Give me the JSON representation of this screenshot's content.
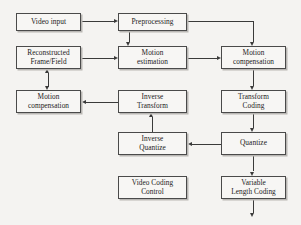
{
  "diagram": {
    "background_color": "#f4f3f1",
    "box_fill_color": "#f7f6f4",
    "box_border_color": "#4a4a4a",
    "line_color": "#3a3a3a",
    "nodes": [
      {
        "id": "video-input",
        "label": "Video input",
        "x": 16,
        "y": 13,
        "w": 65,
        "h": 18,
        "lines": 1
      },
      {
        "id": "preprocessing",
        "label": "Preprocessing",
        "x": 118,
        "y": 13,
        "w": 69,
        "h": 18,
        "lines": 1
      },
      {
        "id": "reconstructed-frame",
        "label": "Reconstructed\nFrame/Field",
        "x": 16,
        "y": 46,
        "w": 65,
        "h": 23,
        "lines": 2
      },
      {
        "id": "motion-estimation",
        "label": "Motion\nestimation",
        "x": 118,
        "y": 46,
        "w": 69,
        "h": 23,
        "lines": 2
      },
      {
        "id": "motion-compensation-top",
        "label": "Motion\ncompensation",
        "x": 221,
        "y": 46,
        "w": 65,
        "h": 23,
        "lines": 2
      },
      {
        "id": "motion-compensation-bottom",
        "label": "Motion\ncompensation",
        "x": 16,
        "y": 90,
        "w": 65,
        "h": 23,
        "lines": 2
      },
      {
        "id": "inverse-transform",
        "label": "Inverse\nTransform",
        "x": 118,
        "y": 90,
        "w": 69,
        "h": 23,
        "lines": 2
      },
      {
        "id": "transform-coding",
        "label": "Transform\nCoding",
        "x": 221,
        "y": 90,
        "w": 65,
        "h": 23,
        "lines": 2
      },
      {
        "id": "inverse-quantize",
        "label": "Inverse\nQuantize",
        "x": 118,
        "y": 132,
        "w": 69,
        "h": 23,
        "lines": 2
      },
      {
        "id": "quantize",
        "label": "Quantize",
        "x": 221,
        "y": 132,
        "w": 65,
        "h": 23,
        "lines": 1
      },
      {
        "id": "video-coding-control",
        "label": "Video Coding\nControl",
        "x": 118,
        "y": 176,
        "w": 69,
        "h": 23,
        "lines": 2
      },
      {
        "id": "variable-length-coding",
        "label": "Variable\nLength Coding",
        "x": 221,
        "y": 176,
        "w": 65,
        "h": 23,
        "lines": 2
      }
    ],
    "edges": [
      {
        "id": "video-input-to-preprocessing",
        "from": "video-input",
        "to": "preprocessing"
      },
      {
        "id": "preprocessing-to-motion-estimation",
        "from": "preprocessing",
        "to": "motion-estimation"
      },
      {
        "id": "preprocessing-to-motion-compensation-top",
        "from": "preprocessing",
        "to": "motion-compensation-top"
      },
      {
        "id": "reconstructed-to-motion-estimation",
        "from": "reconstructed-frame",
        "to": "motion-estimation"
      },
      {
        "id": "motion-estimation-to-motion-compensation",
        "from": "motion-estimation",
        "to": "motion-compensation-top"
      },
      {
        "id": "motion-compensation-to-transform-coding",
        "from": "motion-compensation-top",
        "to": "transform-coding"
      },
      {
        "id": "transform-coding-to-quantize",
        "from": "transform-coding",
        "to": "quantize"
      },
      {
        "id": "quantize-to-inverse-quantize",
        "from": "quantize",
        "to": "inverse-quantize"
      },
      {
        "id": "quantize-to-variable-length-coding",
        "from": "quantize",
        "to": "variable-length-coding"
      },
      {
        "id": "inverse-quantize-to-inverse-transform",
        "from": "inverse-quantize",
        "to": "inverse-transform"
      },
      {
        "id": "inverse-transform-to-motion-compensation",
        "from": "inverse-transform",
        "to": "motion-compensation-bottom"
      },
      {
        "id": "motion-compensation-to-reconstructed",
        "from": "motion-compensation-bottom",
        "to": "reconstructed-frame",
        "bidirectional": true
      },
      {
        "id": "variable-length-coding-output",
        "from": "variable-length-coding",
        "to": "output"
      }
    ]
  }
}
